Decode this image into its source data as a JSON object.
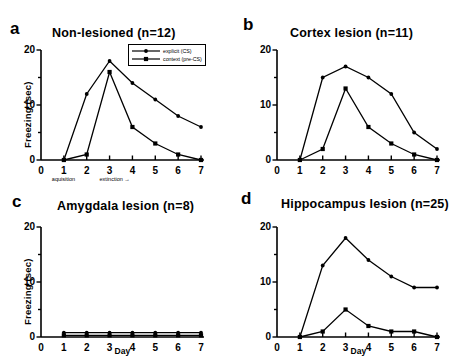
{
  "figure": {
    "panels": [
      {
        "letter": "a",
        "title": "Non-lesioned  (n=12)",
        "ylabel": "Freezing  (sec)",
        "has_legend": true,
        "has_day_label": false,
        "has_phase_labels": true
      },
      {
        "letter": "b",
        "title": "Cortex lesion (n=11)",
        "ylabel": "",
        "has_legend": false,
        "has_day_label": false,
        "has_phase_labels": false
      },
      {
        "letter": "c",
        "title": "Amygdala lesion (n=8)",
        "ylabel": "Freezing  (sec)",
        "has_legend": false,
        "has_day_label": true,
        "has_phase_labels": false
      },
      {
        "letter": "d",
        "title": "Hippocampus lesion (n=25)",
        "ylabel": "",
        "has_legend": false,
        "has_day_label": true,
        "has_phase_labels": false
      }
    ],
    "legend": {
      "explicit_label": "explicit (CS)",
      "context_label": "context (pre-CS)"
    },
    "axis_sublabels": {
      "acquisition": "aquisition",
      "extinction": "extinction  →"
    },
    "day_axis_label": "Day",
    "line_color": "#000000"
  },
  "chart_data": [
    {
      "type": "line",
      "panel": "a",
      "title": "Non-lesioned  (n=12)",
      "xlabel": "Day",
      "ylabel": "Freezing  (sec)",
      "x": [
        1,
        2,
        3,
        4,
        5,
        6,
        7
      ],
      "xticks": [
        0,
        1,
        2,
        3,
        4,
        5,
        6,
        7
      ],
      "yticks": [
        0,
        10,
        20
      ],
      "xlim": [
        0,
        7
      ],
      "ylim": [
        0,
        20
      ],
      "grid": false,
      "legend_position": "top-right",
      "series": [
        {
          "name": "explicit (CS)",
          "marker": "dot",
          "values": [
            0,
            12,
            18,
            14,
            11,
            8,
            6
          ]
        },
        {
          "name": "context (pre-CS)",
          "marker": "square",
          "values": [
            0,
            1,
            16,
            6,
            3,
            1,
            0
          ]
        }
      ],
      "annotations": [
        "aquisition",
        "extinction  →"
      ]
    },
    {
      "type": "line",
      "panel": "b",
      "title": "Cortex lesion (n=11)",
      "xlabel": "",
      "ylabel": "",
      "x": [
        1,
        2,
        3,
        4,
        5,
        6,
        7
      ],
      "xticks": [
        0,
        1,
        2,
        3,
        4,
        5,
        6,
        7
      ],
      "yticks": [
        0,
        10,
        20
      ],
      "xlim": [
        0,
        7
      ],
      "ylim": [
        0,
        20
      ],
      "grid": false,
      "legend_position": "none",
      "series": [
        {
          "name": "explicit (CS)",
          "marker": "dot",
          "values": [
            0,
            15,
            17,
            15,
            12,
            5,
            2
          ]
        },
        {
          "name": "context (pre-CS)",
          "marker": "square",
          "values": [
            0,
            2,
            13,
            6,
            3,
            1,
            0
          ]
        }
      ]
    },
    {
      "type": "line",
      "panel": "c",
      "title": "Amygdala lesion (n=8)",
      "xlabel": "Day",
      "ylabel": "Freezing  (sec)",
      "x": [
        1,
        2,
        3,
        4,
        5,
        6,
        7
      ],
      "xticks": [
        0,
        1,
        2,
        3,
        4,
        5,
        6,
        7
      ],
      "yticks": [
        0,
        10,
        20
      ],
      "xlim": [
        0,
        7
      ],
      "ylim": [
        0,
        20
      ],
      "grid": false,
      "legend_position": "none",
      "series": [
        {
          "name": "explicit (CS)",
          "marker": "dot",
          "values": [
            0.8,
            0.8,
            0.8,
            0.8,
            0.8,
            0.8,
            0.8
          ]
        },
        {
          "name": "context (pre-CS)",
          "marker": "square",
          "values": [
            0.3,
            0.3,
            0.3,
            0.3,
            0.3,
            0.3,
            0.3
          ]
        }
      ]
    },
    {
      "type": "line",
      "panel": "d",
      "title": "Hippocampus lesion (n=25)",
      "xlabel": "Day",
      "ylabel": "",
      "x": [
        1,
        2,
        3,
        4,
        5,
        6,
        7
      ],
      "xticks": [
        0,
        1,
        2,
        3,
        4,
        5,
        6,
        7
      ],
      "yticks": [
        0,
        10,
        20
      ],
      "xlim": [
        0,
        7
      ],
      "ylim": [
        0,
        20
      ],
      "grid": false,
      "legend_position": "none",
      "series": [
        {
          "name": "explicit (CS)",
          "marker": "dot",
          "values": [
            0,
            13,
            18,
            14,
            11,
            9,
            9
          ]
        },
        {
          "name": "context (pre-CS)",
          "marker": "square",
          "values": [
            0,
            1,
            5,
            2,
            1,
            1,
            0
          ]
        }
      ]
    }
  ]
}
